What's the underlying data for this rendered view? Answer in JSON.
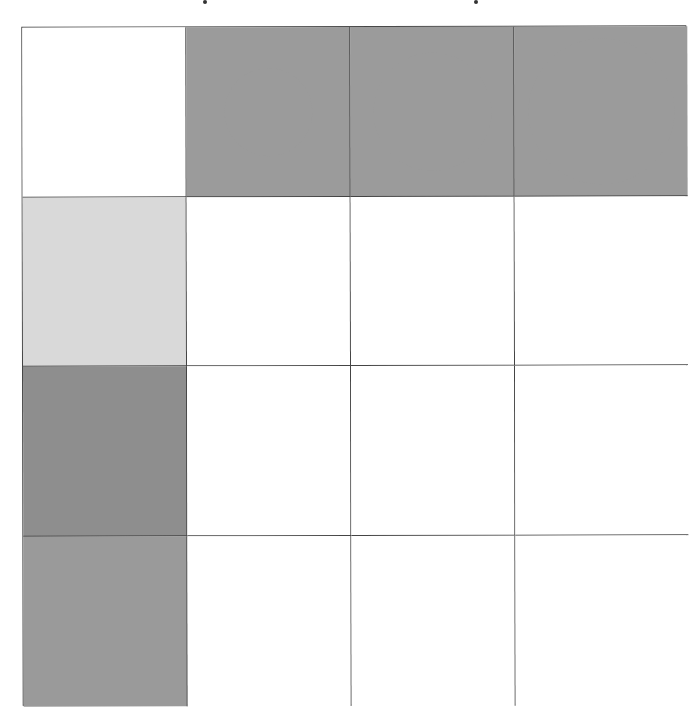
{
  "figure": {
    "type": "matrix-puzzle",
    "rows": 4,
    "cols": 4,
    "colors": {
      "grid_line": "#444444",
      "circle_fill": "#9b9b9b",
      "background": "#ffffff"
    },
    "cells": [
      [
        {
          "content": "empty",
          "fill": "#ffffff"
        },
        {
          "content": "circle",
          "size": "small",
          "diameter": 88,
          "fill": "#9b9b9b"
        },
        {
          "content": "circle",
          "size": "medium",
          "diameter": 118,
          "fill": "#9b9b9b"
        },
        {
          "content": "circle",
          "size": "large",
          "diameter": 146,
          "fill": "#9b9b9b"
        }
      ],
      [
        {
          "content": "filled-square",
          "shade": "light-gray",
          "fill": "#d9d9d9"
        },
        {
          "content": "empty",
          "fill": "#ffffff"
        },
        {
          "content": "empty",
          "fill": "#ffffff"
        },
        {
          "content": "empty",
          "fill": "#ffffff"
        }
      ],
      [
        {
          "content": "filled-square",
          "shade": "dark-gray",
          "fill": "#8e8e8e"
        },
        {
          "content": "empty",
          "fill": "#ffffff"
        },
        {
          "content": "empty",
          "fill": "#ffffff"
        },
        {
          "content": "empty",
          "fill": "#ffffff"
        }
      ],
      [
        {
          "content": "filled-square",
          "shade": "medium-gray",
          "fill": "#9a9a9a"
        },
        {
          "content": "empty",
          "fill": "#ffffff"
        },
        {
          "content": "empty",
          "fill": "#ffffff"
        },
        {
          "content": "empty",
          "fill": "#ffffff"
        }
      ]
    ]
  }
}
